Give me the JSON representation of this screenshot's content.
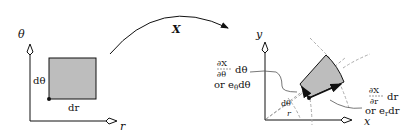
{
  "left_panel": {
    "y_axis_label": "θ",
    "x_axis_label": "r",
    "side_label_vertical": "dθ",
    "side_label_horizontal": "dr"
  },
  "mapping": {
    "label": "X"
  },
  "right_panel": {
    "y_axis_label": "y",
    "x_axis_label": "x",
    "theta_annotation": {
      "numerator": "∂X",
      "denominator": "∂θ",
      "suffix": "dθ",
      "alt": "or e",
      "alt_sub": "θ",
      "alt_suffix": "dθ"
    },
    "r_annotation": {
      "numerator": "∂X",
      "denominator": "∂r",
      "suffix": "dr",
      "alt": "or e",
      "alt_sub": "r",
      "alt_suffix": "dr"
    },
    "angle_label": "dθ",
    "radius_label": "r"
  },
  "colors": {
    "fill": "#bdbdbd",
    "line": "#111111",
    "dashed": "#aaaaaa"
  }
}
